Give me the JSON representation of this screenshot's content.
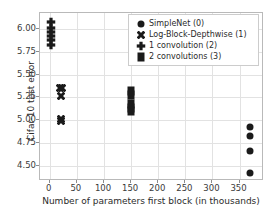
{
  "chart_data": {
    "type": "scatter",
    "title": "",
    "xlabel": "Number of parameters first block (in thousands)",
    "ylabel": "Cifar-10 test error",
    "xlim": [
      -18,
      395
    ],
    "ylim": [
      4.33,
      6.18
    ],
    "xticks": [
      0,
      50,
      100,
      150,
      200,
      250,
      300,
      350
    ],
    "xticklabels": [
      "0",
      "50",
      "100",
      "150",
      "200",
      "250",
      "300",
      "350"
    ],
    "yticks": [
      4.5,
      4.75,
      5.0,
      5.25,
      5.5,
      5.75,
      6.0
    ],
    "yticklabels": [
      "4.50",
      "4.75",
      "5.00",
      "5.25",
      "5.50",
      "5.75",
      "6.00"
    ],
    "grid": true,
    "grid_color": "#e2e2e2",
    "marker_color": "#1a1a1a",
    "legend_position": "upper right",
    "series": [
      {
        "name": "SimpleNet (0)",
        "marker": "circle",
        "points": [
          {
            "x": 370,
            "y": 4.93
          },
          {
            "x": 370,
            "y": 4.83
          },
          {
            "x": 370,
            "y": 4.66
          },
          {
            "x": 370,
            "y": 4.42
          }
        ]
      },
      {
        "name": "Log-Block-Depthwise (1)",
        "marker": "x",
        "points": [
          {
            "x": 19,
            "y": 5.35
          },
          {
            "x": 22,
            "y": 5.35
          },
          {
            "x": 20,
            "y": 5.27
          },
          {
            "x": 20,
            "y": 5.01
          },
          {
            "x": 20,
            "y": 4.99
          }
        ]
      },
      {
        "name": "1 convolution (2)",
        "marker": "plus",
        "points": [
          {
            "x": 3,
            "y": 6.08
          },
          {
            "x": 3,
            "y": 6.01
          },
          {
            "x": 3,
            "y": 5.97
          },
          {
            "x": 3,
            "y": 5.93
          },
          {
            "x": 3,
            "y": 5.88
          },
          {
            "x": 3,
            "y": 5.83
          }
        ]
      },
      {
        "name": "2 convolutions (3)",
        "marker": "square",
        "points": [
          {
            "x": 150,
            "y": 5.32
          },
          {
            "x": 150,
            "y": 5.28
          },
          {
            "x": 150,
            "y": 5.18
          },
          {
            "x": 150,
            "y": 5.13
          },
          {
            "x": 150,
            "y": 5.1
          }
        ]
      }
    ]
  },
  "legend": {
    "items": [
      {
        "label": "SimpleNet (0)",
        "marker": "circle"
      },
      {
        "label": "Log-Block-Depthwise (1)",
        "marker": "x"
      },
      {
        "label": "1 convolution (2)",
        "marker": "plus"
      },
      {
        "label": "2 convolutions (3)",
        "marker": "square"
      }
    ]
  }
}
